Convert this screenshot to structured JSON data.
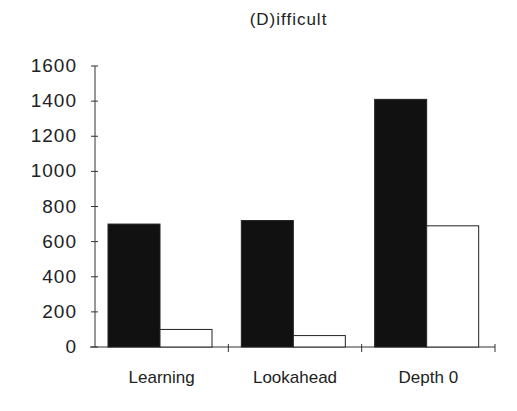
{
  "chart_data": {
    "type": "bar",
    "title": "(D)ifficult",
    "xlabel": "",
    "ylabel": "",
    "categories": [
      "Learning",
      "Lookahead",
      "Depth 0"
    ],
    "series": [
      {
        "name": "series-1 (black)",
        "color": "#111111",
        "values": [
          700,
          720,
          1410
        ]
      },
      {
        "name": "series-2 (white)",
        "color": "#ffffff",
        "values": [
          100,
          65,
          690
        ]
      }
    ],
    "ylim": [
      0,
      1600
    ],
    "yticks": [
      "0",
      "200",
      "400",
      "600",
      "800",
      "1000",
      "1200",
      "1400",
      "1600"
    ],
    "grid": false,
    "legend": "none"
  }
}
